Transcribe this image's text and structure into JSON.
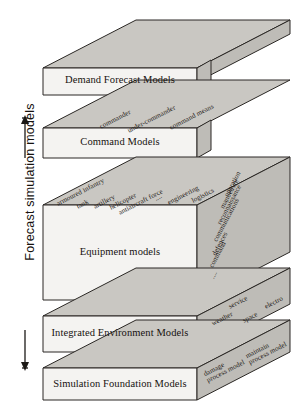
{
  "diagram": {
    "type": "layered-3d-stack",
    "axis": {
      "caption": "Forecast simulation models",
      "arrow": "double-headed-vertical"
    },
    "colors": {
      "front_face": "#f4f3f1",
      "top_face": "#c9c7c2",
      "side_face": "#bebcb7",
      "outline": "#2a2724",
      "text": "#16120f",
      "background": "#ffffff"
    },
    "layers": [
      {
        "id": "demand-forecast-models",
        "label": "Demand Forecast Models",
        "top_labels": [],
        "side_labels": []
      },
      {
        "id": "command-models",
        "label": "Command Models",
        "top_labels": [
          "commander",
          "under-commander",
          "command means"
        ],
        "side_labels": []
      },
      {
        "id": "equipment-models",
        "label": "Equipment models",
        "top_labels": [
          "armoured infantry",
          "tank",
          "artillery",
          "helicopter",
          "antiaircraft force",
          "....",
          "engineering",
          "logistics"
        ],
        "side_labels": [
          "operation",
          "manoeuvre",
          "reconnaissance",
          "communications",
          "defences",
          "command",
          "...."
        ]
      },
      {
        "id": "integrated-environment-models",
        "label": "Integrated Environment Models",
        "top_labels": [
          "service",
          "electro"
        ],
        "side_labels": [
          "weather",
          "space"
        ]
      },
      {
        "id": "simulation-foundation-models",
        "label": "Simulation Foundation Models",
        "top_labels": [
          "maintain\nprocess model"
        ],
        "side_labels": [
          "damage\nprocess model"
        ]
      }
    ]
  }
}
